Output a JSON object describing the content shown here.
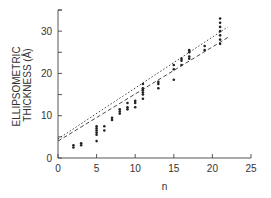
{
  "chart_data": {
    "type": "scatter",
    "title": "",
    "xlabel": "n",
    "ylabel": "ELLIPSOMETRIC THICKNESS (Å)",
    "ylabel_lines": [
      "ELLIPSOMETRIC",
      "THICKNESS (Å)"
    ],
    "xlim": [
      0,
      25
    ],
    "ylim": [
      0,
      35
    ],
    "xticks": [
      0,
      5,
      10,
      15,
      20,
      25
    ],
    "yticks": [
      0,
      10,
      20,
      30
    ],
    "grid": false,
    "legend": null,
    "series": [
      {
        "name": "measured",
        "style": "points",
        "points": [
          [
            2,
            2.5
          ],
          [
            2,
            3
          ],
          [
            3,
            3
          ],
          [
            3,
            3.5
          ],
          [
            5,
            4
          ],
          [
            5,
            5.5
          ],
          [
            5,
            6
          ],
          [
            5,
            6.5
          ],
          [
            5,
            7
          ],
          [
            5,
            7.5
          ],
          [
            6,
            6.5
          ],
          [
            6,
            7.5
          ],
          [
            7,
            9
          ],
          [
            7,
            9.5
          ],
          [
            8,
            10.5
          ],
          [
            8,
            11
          ],
          [
            8,
            11.5
          ],
          [
            9,
            11.5
          ],
          [
            9,
            12
          ],
          [
            9,
            13
          ],
          [
            10,
            12
          ],
          [
            10,
            13
          ],
          [
            10,
            13.5
          ],
          [
            11,
            14
          ],
          [
            11,
            15
          ],
          [
            11,
            15.5
          ],
          [
            11,
            16
          ],
          [
            11,
            16.5
          ],
          [
            11,
            17.5
          ],
          [
            13,
            16.5
          ],
          [
            13,
            17.5
          ],
          [
            13,
            18
          ],
          [
            15,
            18.5
          ],
          [
            15,
            21
          ],
          [
            15,
            22
          ],
          [
            16,
            22
          ],
          [
            16,
            23
          ],
          [
            16,
            23.5
          ],
          [
            17,
            23.5
          ],
          [
            17,
            24
          ],
          [
            17,
            25
          ],
          [
            17,
            25.5
          ],
          [
            19,
            25.5
          ],
          [
            19,
            26.5
          ],
          [
            21,
            27
          ],
          [
            21,
            28
          ],
          [
            21,
            29
          ],
          [
            21,
            30
          ],
          [
            21,
            31
          ],
          [
            21,
            32
          ],
          [
            21,
            33
          ]
        ]
      },
      {
        "name": "fit-upper",
        "style": "dotted-line",
        "points": [
          [
            0,
            4.5
          ],
          [
            22,
            31
          ]
        ]
      },
      {
        "name": "fit-lower",
        "style": "dashed-line",
        "points": [
          [
            0,
            4
          ],
          [
            22,
            28.5
          ]
        ]
      }
    ]
  }
}
